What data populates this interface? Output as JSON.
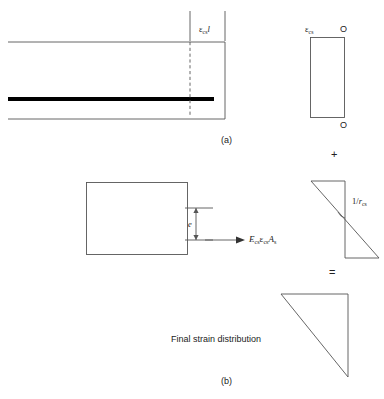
{
  "figure": {
    "caption_a": "(a)",
    "caption_b": "(b)",
    "part_a": {
      "beam_strain_label_eps": "ε",
      "beam_strain_label_sub": "cs",
      "beam_strain_label_len": "l",
      "shrinkage_block_label_eps": "ε",
      "shrinkage_block_label_sub": "cs",
      "zero_top": "O",
      "zero_bottom": "O"
    },
    "operators": {
      "plus": "+",
      "equals": "="
    },
    "part_b": {
      "eccentricity_label": "e",
      "force_label_E": "E",
      "force_label_E_sub": "cs",
      "force_label_eps": "ε",
      "force_label_eps_sub": "cs",
      "force_label_A": "A",
      "force_label_A_sub": "s",
      "curvature_label_num": "1/",
      "curvature_label_r": "r",
      "curvature_label_sub": "cs",
      "final_distribution_label": "Final strain distribution"
    }
  },
  "colors": {
    "line": "#555555",
    "rebar": "#000000",
    "text": "#222222",
    "background": "#ffffff"
  }
}
